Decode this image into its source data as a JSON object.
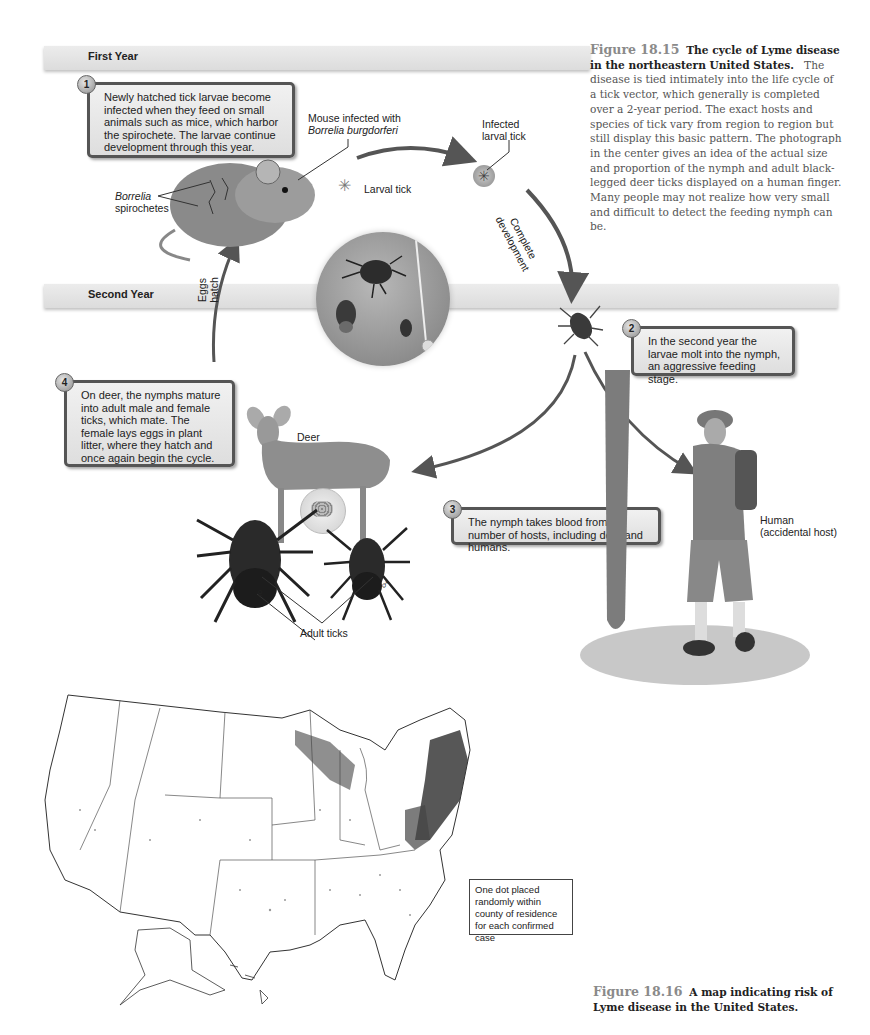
{
  "figure_15": {
    "bands": {
      "first_year": "First Year",
      "second_year": "Second Year"
    },
    "steps": [
      {
        "number": "1",
        "text": "Newly hatched tick larvae become infected when they feed on small animals such as mice, which harbor the spirochete. The larvae continue development through this year."
      },
      {
        "number": "2",
        "text": "In the second year the larvae molt into the nymph, an aggressive feeding stage."
      },
      {
        "number": "3",
        "text": "The nymph takes blood from a number of hosts, including deer and humans."
      },
      {
        "number": "4",
        "text": "On deer, the nymphs mature into adult male and female ticks, which mate. The female lays eggs in plant litter, where they hatch and once again begin the cycle."
      }
    ],
    "labels": {
      "mouse_line1": "Mouse infected with",
      "mouse_line2": "Borrelia burgdorferi",
      "borrelia": "Borrelia",
      "spirochetes": "spirochetes",
      "larval_tick": "Larval tick",
      "infected_line1": "Infected",
      "infected_line2": "larval tick",
      "complete": "Complete",
      "development": "development",
      "eggs": "Eggs",
      "hatch": "hatch",
      "deer": "Deer",
      "human_line1": "Human",
      "human_line2": "(accidental host)",
      "adult_ticks": "Adult ticks",
      "female_symbol": "♀",
      "male_symbol": "♂"
    },
    "caption": {
      "number": "Figure 18.15",
      "title": "The cycle of Lyme disease in the northeastern United States.",
      "body": "The disease is tied intimately into the life cycle of a tick vector, which generally is completed over a 2-year period. The exact hosts and species of tick vary from region to region but still display this basic pattern. The photograph in the center gives an idea of the actual size and proportion of the nymph and adult black-legged deer ticks displayed on a human finger. Many people may not realize how very small and difficult to detect the feeding nymph can be."
    }
  },
  "figure_16": {
    "legend": "One dot placed randomly within county of residence for each confirmed case",
    "caption": {
      "number": "Figure 18.16",
      "title": "A map indicating risk of Lyme disease in the United States."
    }
  },
  "colors": {
    "band": "#e2e2e2",
    "box_border": "#555555",
    "arrow": "#555555",
    "caption_text": "#555555",
    "fig_number": "#8a8a8a",
    "dot_heavy": "#333333"
  }
}
